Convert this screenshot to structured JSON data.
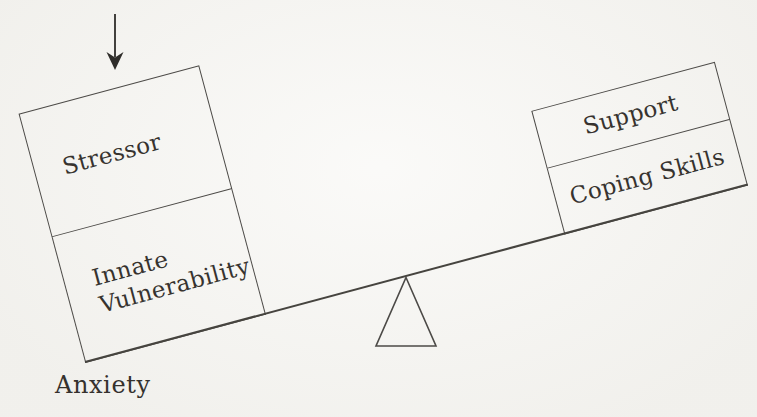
{
  "diagram": {
    "type": "balance-seesaw",
    "arrow": {
      "direction": "down",
      "points_at": "Stressor"
    },
    "left_side": {
      "position": "down",
      "boxes": [
        {
          "label": "Stressor"
        },
        {
          "label": "Innate Vulnerability"
        }
      ],
      "caption": "Anxiety"
    },
    "right_side": {
      "position": "up",
      "boxes": [
        {
          "label": "Support"
        },
        {
          "label": "Coping Skills"
        }
      ]
    },
    "fulcrum": {
      "shape": "triangle",
      "filled": false
    },
    "colors": {
      "line": "#4c4a47",
      "text": "#36322e",
      "background": "#f5f4f0"
    }
  }
}
